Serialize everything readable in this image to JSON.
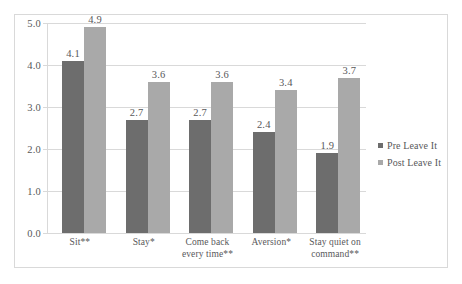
{
  "chart_data": {
    "type": "bar",
    "title": "",
    "subtitle": "",
    "xlabel": "",
    "ylabel": "",
    "ylim": [
      0.0,
      5.0
    ],
    "ytick_labels": [
      "5.0",
      "4.0",
      "3.0",
      "2.0",
      "1.0",
      "0.0"
    ],
    "ytick_values": [
      5.0,
      4.0,
      3.0,
      2.0,
      1.0,
      0.0
    ],
    "grid": true,
    "legend_position": "right",
    "categories": [
      "Sit**",
      "Stay*",
      "Come back every time**",
      "Aversion*",
      "Stay quiet on command**"
    ],
    "category_lines": [
      [
        "Sit**"
      ],
      [
        "Stay*"
      ],
      [
        "Come back",
        "every time**"
      ],
      [
        "Aversion*"
      ],
      [
        "Stay quiet on",
        "command**"
      ]
    ],
    "series": [
      {
        "name": "Pre Leave It",
        "color": "#6d6d6d",
        "values": [
          4.1,
          2.7,
          2.7,
          2.4,
          1.9
        ],
        "labels": [
          "4.1",
          "2.7",
          "2.7",
          "2.4",
          "1.9"
        ]
      },
      {
        "name": "Post Leave It",
        "color": "#a9a9a9",
        "values": [
          4.9,
          3.6,
          3.6,
          3.4,
          3.7
        ],
        "labels": [
          "4.9",
          "3.6",
          "3.6",
          "3.4",
          "3.7"
        ]
      }
    ]
  },
  "legend": {
    "items": [
      {
        "label": "Pre Leave It"
      },
      {
        "label": "Post Leave It"
      }
    ]
  },
  "colors": {
    "pre": "#6d6d6d",
    "post": "#a9a9a9",
    "grid": "#d9d9d9",
    "text": "#58585a",
    "frame": "#d9d9d9",
    "background": "#ffffff"
  }
}
